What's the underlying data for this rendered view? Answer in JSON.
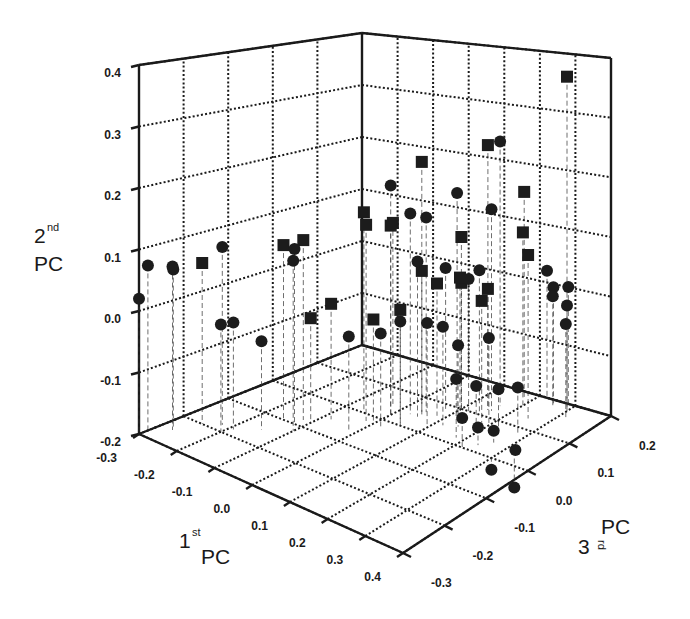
{
  "chart_data": {
    "type": "scatter",
    "projection": "3d",
    "title": "",
    "axes": {
      "x": {
        "label": "1st PC",
        "label_main": "1",
        "label_sup": "st",
        "label_tail": "PC",
        "range": [
          -0.3,
          0.4
        ],
        "ticks": [
          "-0.3",
          "-0.2",
          "-0.1",
          "0.0",
          "0.1",
          "0.2",
          "0.3",
          "0.4"
        ]
      },
      "y": {
        "label": "2nd PC",
        "label_main": "2",
        "label_sup": "nd",
        "label_tail": "PC",
        "range": [
          -0.2,
          0.4
        ],
        "ticks": [
          "-0.2",
          "-0.1",
          "0.0",
          "0.1",
          "0.2",
          "0.3",
          "0.4"
        ]
      },
      "z": {
        "label": "3rd PC",
        "label_main": "3",
        "label_sup": "rd",
        "label_tail": "PC",
        "range": [
          -0.3,
          0.2
        ],
        "ticks": [
          "-0.3",
          "-0.2",
          "-0.1",
          "0.0",
          "0.1",
          "0.2"
        ]
      }
    },
    "grid": true,
    "legend": null,
    "drop_lines": true,
    "series": [
      {
        "name": "Group A (squares)",
        "marker": "square",
        "points": [
          {
            "x": 0.3,
            "y": 0.37,
            "z": 0.18
          },
          {
            "x": 0.15,
            "y": 0.26,
            "z": 0.12
          },
          {
            "x": 0.05,
            "y": 0.24,
            "z": 0.05
          },
          {
            "x": 0.18,
            "y": 0.16,
            "z": 0.18
          },
          {
            "x": 0.2,
            "y": 0.1,
            "z": 0.16
          },
          {
            "x": 0.25,
            "y": 0.08,
            "z": 0.13
          },
          {
            "x": -0.05,
            "y": 0.15,
            "z": 0.0
          },
          {
            "x": -0.02,
            "y": 0.14,
            "z": -0.02
          },
          {
            "x": 0.0,
            "y": 0.13,
            "z": 0.02
          },
          {
            "x": -0.15,
            "y": 0.1,
            "z": -0.1
          },
          {
            "x": -0.12,
            "y": 0.11,
            "z": -0.08
          },
          {
            "x": -0.25,
            "y": 0.07,
            "z": -0.2
          },
          {
            "x": -0.03,
            "y": 0.12,
            "z": 0.05
          },
          {
            "x": 0.05,
            "y": 0.05,
            "z": 0.05
          },
          {
            "x": 0.08,
            "y": 0.03,
            "z": 0.06
          },
          {
            "x": 0.1,
            "y": 0.02,
            "z": 0.1
          },
          {
            "x": 0.12,
            "y": 0.04,
            "z": 0.08
          },
          {
            "x": 0.15,
            "y": 0.01,
            "z": 0.12
          },
          {
            "x": 0.05,
            "y": 0.0,
            "z": 0.0
          },
          {
            "x": 0.0,
            "y": -0.02,
            "z": -0.02
          },
          {
            "x": -0.08,
            "y": 0.0,
            "z": -0.05
          },
          {
            "x": -0.1,
            "y": -0.02,
            "z": -0.08
          },
          {
            "x": 0.18,
            "y": 0.01,
            "z": 0.08
          },
          {
            "x": 0.1,
            "y": 0.1,
            "z": 0.1
          }
        ]
      },
      {
        "name": "Group B (circles)",
        "marker": "circle",
        "points": [
          {
            "x": 0.16,
            "y": 0.26,
            "z": 0.14
          },
          {
            "x": 0.0,
            "y": 0.2,
            "z": 0.02
          },
          {
            "x": 0.1,
            "y": 0.18,
            "z": 0.09
          },
          {
            "x": 0.16,
            "y": 0.15,
            "z": 0.12
          },
          {
            "x": 0.05,
            "y": 0.14,
            "z": 0.06
          },
          {
            "x": 0.03,
            "y": 0.15,
            "z": 0.04
          },
          {
            "x": -0.22,
            "y": 0.1,
            "z": -0.18
          },
          {
            "x": -0.3,
            "y": 0.07,
            "z": -0.28
          },
          {
            "x": -0.27,
            "y": 0.07,
            "z": -0.25
          },
          {
            "x": -0.28,
            "y": 0.06,
            "z": -0.24
          },
          {
            "x": -0.3,
            "y": 0.02,
            "z": -0.3
          },
          {
            "x": -0.12,
            "y": 0.1,
            "z": -0.1
          },
          {
            "x": -0.1,
            "y": 0.09,
            "z": -0.12
          },
          {
            "x": -0.2,
            "y": -0.02,
            "z": -0.2
          },
          {
            "x": -0.19,
            "y": -0.02,
            "z": -0.18
          },
          {
            "x": -0.15,
            "y": -0.05,
            "z": -0.15
          },
          {
            "x": 0.05,
            "y": 0.07,
            "z": 0.04
          },
          {
            "x": 0.12,
            "y": 0.03,
            "z": 0.1
          },
          {
            "x": 0.15,
            "y": 0.05,
            "z": 0.1
          },
          {
            "x": 0.22,
            "y": 0.02,
            "z": 0.2
          },
          {
            "x": 0.25,
            "y": 0.0,
            "z": 0.19
          },
          {
            "x": 0.26,
            "y": -0.01,
            "z": 0.18
          },
          {
            "x": 0.28,
            "y": 0.0,
            "z": 0.2
          },
          {
            "x": 0.3,
            "y": -0.02,
            "z": 0.18
          },
          {
            "x": 0.32,
            "y": -0.04,
            "z": 0.16
          },
          {
            "x": 0.1,
            "y": -0.02,
            "z": 0.02
          },
          {
            "x": 0.12,
            "y": -0.03,
            "z": 0.04
          },
          {
            "x": 0.15,
            "y": -0.06,
            "z": 0.05
          },
          {
            "x": 0.2,
            "y": -0.05,
            "z": 0.08
          },
          {
            "x": 0.18,
            "y": -0.1,
            "z": 0.02
          },
          {
            "x": 0.2,
            "y": -0.12,
            "z": 0.05
          },
          {
            "x": 0.25,
            "y": -0.12,
            "z": 0.06
          },
          {
            "x": 0.28,
            "y": -0.12,
            "z": 0.08
          },
          {
            "x": 0.22,
            "y": -0.15,
            "z": 0.0
          },
          {
            "x": 0.24,
            "y": -0.17,
            "z": 0.02
          },
          {
            "x": 0.26,
            "y": -0.18,
            "z": 0.04
          },
          {
            "x": 0.3,
            "y": -0.22,
            "z": 0.0
          },
          {
            "x": 0.32,
            "y": -0.2,
            "z": 0.04
          },
          {
            "x": 0.34,
            "y": -0.25,
            "z": 0.02
          },
          {
            "x": 0.05,
            "y": -0.02,
            "z": 0.0
          },
          {
            "x": 0.02,
            "y": -0.04,
            "z": -0.02
          },
          {
            "x": -0.02,
            "y": -0.04,
            "z": -0.06
          },
          {
            "x": 0.08,
            "y": 0.05,
            "z": 0.08
          }
        ]
      }
    ]
  },
  "labels": {
    "x_main": "1",
    "x_sup": "st",
    "x_tail": "PC",
    "y_main": "2",
    "y_sup": "nd",
    "y_tail": "PC",
    "z_main": "3",
    "z_sup": "rd",
    "z_tail": "PC"
  }
}
